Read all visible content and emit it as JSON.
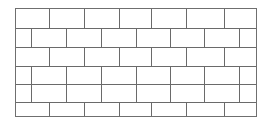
{
  "figure": {
    "canvas": {
      "width": 269,
      "height": 125
    },
    "background_color": "#ffffff"
  },
  "wall": {
    "name": "brick-wall",
    "bond_pattern": "running-bond",
    "outline": {
      "x": 15,
      "y": 8,
      "width": 241,
      "height": 108
    },
    "stroke_color": "#6a6a6a",
    "outline_stroke_color": "#6f6f6f",
    "brick_fill": "#ffffff",
    "stroke_width": 1.1,
    "outline_stroke_width": 1.3,
    "course_count": 6,
    "course_boundaries": [
      8,
      28,
      47,
      66,
      84,
      102,
      116
    ],
    "courses": [
      {
        "index": 1,
        "name": "course-1",
        "offset": "full",
        "brick_count": 7,
        "joint_positions": [
          49,
          84,
          119,
          151,
          186,
          224
        ]
      },
      {
        "index": 2,
        "name": "course-2",
        "offset": "half",
        "brick_count": 8,
        "joint_positions": [
          31,
          66,
          101,
          136,
          170,
          204,
          239
        ]
      },
      {
        "index": 3,
        "name": "course-3",
        "offset": "full",
        "brick_count": 7,
        "joint_positions": [
          49,
          84,
          119,
          151,
          186,
          224
        ]
      },
      {
        "index": 4,
        "name": "course-4",
        "offset": "half",
        "brick_count": 8,
        "joint_positions": [
          31,
          66,
          101,
          136,
          170,
          204,
          239
        ]
      },
      {
        "index": 5,
        "name": "course-5",
        "offset": "half",
        "brick_count": 8,
        "joint_positions": [
          31,
          66,
          101,
          136,
          170,
          204,
          239
        ]
      },
      {
        "index": 6,
        "name": "course-6",
        "offset": "full",
        "brick_count": 7,
        "joint_positions": [
          49,
          84,
          119,
          151,
          186,
          224
        ]
      }
    ]
  }
}
